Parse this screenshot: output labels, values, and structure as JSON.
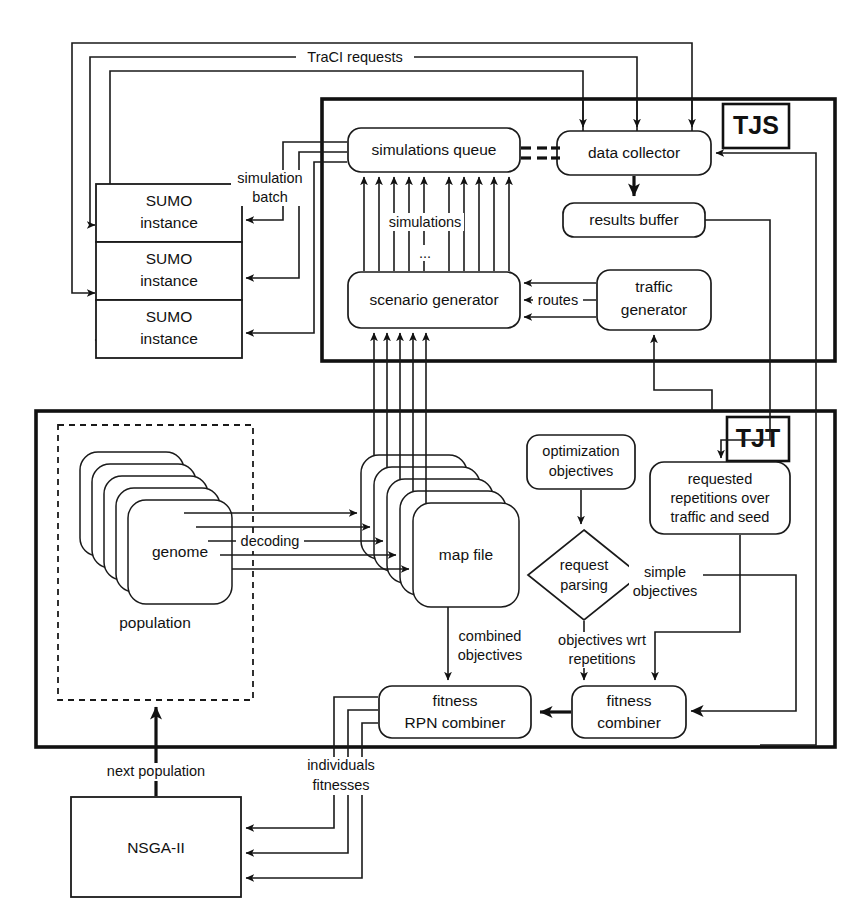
{
  "figure": {
    "type": "system-architecture-block-diagram",
    "title_visible": false,
    "background": "#ffffff",
    "ink": "#111111"
  },
  "groups": [
    {
      "id": "tjs",
      "tag": "TJS",
      "x": 322,
      "y": 99,
      "w": 513,
      "h": 262
    },
    {
      "id": "tjt",
      "tag": "TJT",
      "x": 36,
      "y": 411,
      "w": 799,
      "h": 336
    }
  ],
  "subgroups": [
    {
      "id": "population",
      "label": "population",
      "x": 58,
      "y": 425,
      "w": 195,
      "h": 275
    }
  ],
  "nodes": {
    "sumo_instance_1": {
      "label_lines": [
        "SUMO",
        "instance"
      ],
      "shape": "rect",
      "x": 96,
      "y": 184,
      "w": 146,
      "h": 58
    },
    "sumo_instance_2": {
      "label_lines": [
        "SUMO",
        "instance"
      ],
      "shape": "rect",
      "x": 96,
      "y": 242,
      "w": 146,
      "h": 58
    },
    "sumo_instance_3": {
      "label_lines": [
        "SUMO",
        "instance"
      ],
      "shape": "rect",
      "x": 96,
      "y": 300,
      "w": 146,
      "h": 58
    },
    "simulations_queue": {
      "label_lines": [
        "simulations queue"
      ],
      "shape": "round",
      "x": 348,
      "y": 128,
      "w": 172,
      "h": 44
    },
    "data_collector": {
      "label_lines": [
        "data collector"
      ],
      "shape": "round",
      "x": 557,
      "y": 131,
      "w": 154,
      "h": 44
    },
    "results_buffer": {
      "label_lines": [
        "results buffer"
      ],
      "shape": "round",
      "x": 563,
      "y": 203,
      "w": 142,
      "h": 34
    },
    "scenario_generator": {
      "label_lines": [
        "scenario generator"
      ],
      "shape": "round",
      "x": 348,
      "y": 272,
      "w": 172,
      "h": 56
    },
    "traffic_generator": {
      "label_lines": [
        "traffic",
        "generator"
      ],
      "shape": "round",
      "x": 597,
      "y": 270,
      "w": 114,
      "h": 60
    },
    "genome": {
      "label_lines": [
        "genome"
      ],
      "shape": "stack",
      "x": 98,
      "y": 498,
      "w": 118,
      "h": 104,
      "cards": 5
    },
    "map_file": {
      "label_lines": [
        "map file"
      ],
      "shape": "stack",
      "x": 412,
      "y": 500,
      "w": 116,
      "h": 104,
      "cards": 5
    },
    "optimization_objectives": {
      "label_lines": [
        "optimization",
        "objectives"
      ],
      "shape": "round",
      "x": 527,
      "y": 435,
      "w": 108,
      "h": 54
    },
    "requested_repetitions": {
      "label_lines": [
        "requested",
        "repetitions over",
        "traffic and seed"
      ],
      "shape": "round",
      "x": 650,
      "y": 462,
      "w": 140,
      "h": 72
    },
    "request_parsing": {
      "label_lines": [
        "request",
        "parsing"
      ],
      "shape": "diamond",
      "x": 528,
      "y": 530,
      "w": 112,
      "h": 90
    },
    "fitness_rpn_combiner": {
      "label_lines": [
        "fitness",
        "RPN combiner"
      ],
      "shape": "round",
      "x": 379,
      "y": 686,
      "w": 152,
      "h": 52
    },
    "fitness_combiner": {
      "label_lines": [
        "fitness",
        "combiner"
      ],
      "shape": "round",
      "x": 572,
      "y": 686,
      "w": 114,
      "h": 52
    },
    "nsga_ii": {
      "label_lines": [
        "NSGA-II"
      ],
      "shape": "rect",
      "x": 71,
      "y": 797,
      "w": 170,
      "h": 100
    }
  },
  "edge_labels": [
    {
      "id": "traci-requests",
      "text": "TraCI requests",
      "x": 354,
      "y": 57
    },
    {
      "id": "simulation-batch",
      "text_lines": [
        "simulation",
        "batch"
      ],
      "x": 268,
      "y": 182
    },
    {
      "id": "simulations",
      "text": "simulations",
      "x": 424,
      "y": 222
    },
    {
      "id": "simulations-ellipsis",
      "text": "...",
      "x": 424,
      "y": 253
    },
    {
      "id": "routes",
      "text": "routes",
      "x": 558,
      "y": 301
    },
    {
      "id": "decoding",
      "text": "decoding",
      "x": 270,
      "y": 542
    },
    {
      "id": "simple-objectives",
      "text_lines": [
        "simple",
        "objectives"
      ],
      "x": 662,
      "y": 573
    },
    {
      "id": "combined-objectives",
      "text_lines": [
        "combined",
        "objectives"
      ],
      "x": 490,
      "y": 638
    },
    {
      "id": "objectives-wrt-reps",
      "text_lines": [
        "objectives wrt",
        "repetitions"
      ],
      "x": 602,
      "y": 641
    },
    {
      "id": "next-population",
      "text": "next population",
      "x": 155,
      "y": 772
    },
    {
      "id": "individuals-fitnesses",
      "text_lines": [
        "individuals",
        "fitnesses"
      ],
      "x": 340,
      "y": 774
    }
  ],
  "legend": {
    "tjs_meaning_visible": false,
    "tjt_meaning_visible": false
  }
}
